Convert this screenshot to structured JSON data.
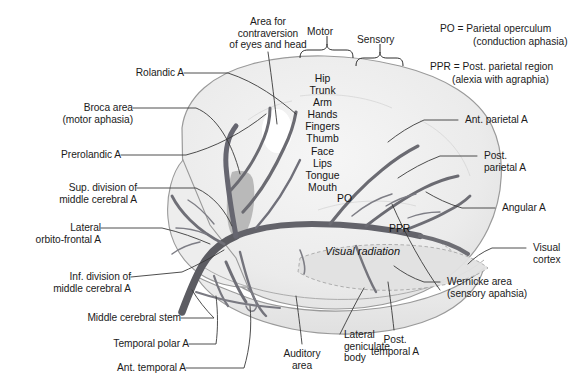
{
  "figure": {
    "colors": {
      "background": "#ffffff",
      "brain_fill": "#ececec",
      "brain_fill_light": "#f3f3f3",
      "brain_outline": "#8e8e8e",
      "artery": "#6b6b70",
      "artery_dark": "#55555b",
      "leader_line": "#3a3a3a",
      "text": "#1b1b1b",
      "broca_patch": "#b8b8b8",
      "contraversion_patch": "#ffffff",
      "visual_radiation_fill": "#dddddd"
    }
  },
  "legend": {
    "entries": [
      {
        "abbr": "PO",
        "line1": "PO = Parietal operculum",
        "line2": "(conduction aphasia)"
      },
      {
        "abbr": "PPR",
        "line1": "PPR = Post. parietal region",
        "line2": "(alexia with agraphia)"
      }
    ]
  },
  "brackets": {
    "motor": "Motor",
    "sensory": "Sensory"
  },
  "homunculus": {
    "name": "homunculus-somatotopy-list",
    "items": [
      "Hip",
      "Trunk",
      "Arm",
      "Hands",
      "Fingers",
      "Thumb",
      "Face",
      "Lips",
      "Tongue",
      "Mouth"
    ]
  },
  "inner_labels": {
    "po": "PO",
    "ppr": "PPR",
    "visual_radiation": "Visual radiation"
  },
  "labels_top": [
    {
      "name": "area-for-contraversion",
      "line1": "Area for",
      "line2": "contraversion",
      "line3": "of eyes and head"
    }
  ],
  "labels_left": [
    {
      "name": "rolandic-artery",
      "line1": "Rolandic A",
      "line2": ""
    },
    {
      "name": "broca-area",
      "line1": "Broca area",
      "line2": "(motor aphasia)"
    },
    {
      "name": "prerolandic-artery",
      "line1": "Prerolandic A",
      "line2": ""
    },
    {
      "name": "sup-division-middle-cerebral-artery",
      "line1": "Sup. division of",
      "line2": "middle cerebral A"
    },
    {
      "name": "lateral-orbito-frontal-artery",
      "line1": "Lateral",
      "line2": "orbito-frontal A"
    },
    {
      "name": "inf-division-middle-cerebral-artery",
      "line1": "Inf. division of",
      "line2": "middle cerebral A"
    },
    {
      "name": "middle-cerebral-stem",
      "line1": "Middle cerebral stem",
      "line2": ""
    },
    {
      "name": "temporal-polar-artery",
      "line1": "Temporal polar A",
      "line2": ""
    },
    {
      "name": "ant-temporal-artery",
      "line1": "Ant. temporal A",
      "line2": ""
    }
  ],
  "labels_right": [
    {
      "name": "ant-parietal-artery",
      "line1": "Ant. parietal A",
      "line2": ""
    },
    {
      "name": "post-parietal-artery",
      "line1": "Post.",
      "line2": "parietal A"
    },
    {
      "name": "angular-artery",
      "line1": "Angular A",
      "line2": ""
    },
    {
      "name": "visual-cortex",
      "line1": "Visual",
      "line2": "cortex"
    },
    {
      "name": "wernicke-area",
      "line1": "Wernicke area",
      "line2": "(sensory apahsia)"
    }
  ],
  "labels_bottom": [
    {
      "name": "auditory-area",
      "line1": "Auditory",
      "line2": "area"
    },
    {
      "name": "lateral-geniculate-body",
      "line1": "Lateral",
      "line2": "geniculate",
      "line3": "body"
    },
    {
      "name": "post-temporal-artery",
      "line1": "Post.",
      "line2": "temporal A"
    }
  ]
}
